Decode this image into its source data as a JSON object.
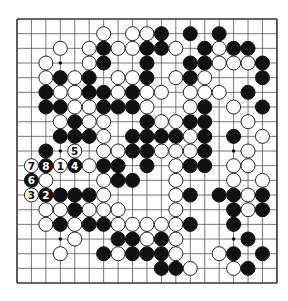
{
  "board": {
    "size": 19,
    "origin_x": 17,
    "origin_y": 19,
    "step_x": 14.44,
    "step_y": 14.67,
    "line_color": "#555555",
    "border_color": "#333333",
    "black_color": "#111111",
    "white_fill": "#ffffff",
    "white_stroke": "#222222",
    "hoshi": [
      [
        3,
        3
      ],
      [
        3,
        9
      ],
      [
        3,
        15
      ],
      [
        9,
        3
      ],
      [
        9,
        9
      ],
      [
        9,
        15
      ],
      [
        15,
        3
      ],
      [
        15,
        9
      ],
      [
        15,
        15
      ]
    ],
    "rows": [
      "...................",
      "......W.WWB.B.B....",
      "...W.WBWWBBW.BWBB..",
      "..W..WB..B..BBWWWB.",
      "..WBWB.WWB.WBW...B.",
      "..BWWBBWBWW.WWW.B..",
      "..BBWWBBBW..WB.W.B.",
      "...WBWW..BWWBB..W..",
      "...BBBW.BBBBWB.B.W.",
      "..B.W.WWBBWWWB..W..",
      ".WBWBWBB.B.WBB.WW..",
      ".BW...WBB..W...W.W.",
      ".WBBBBW....WB.BBWB.",
      "..WWBWWW...W...BWB.",
      "..WBWBBWWWWWB..B...",
      "....W..BBWBW....B..",
      "...W..BWBBBW..WB.B.",
      "..........BBW..WB..",
      "..................."
    ],
    "labels": [
      {
        "row": 10,
        "col": 3,
        "text": "1",
        "color": "W"
      },
      {
        "row": 12,
        "col": 2,
        "text": "2",
        "color": "B"
      },
      {
        "row": 12,
        "col": 1,
        "text": "3",
        "color": "W"
      },
      {
        "row": 10,
        "col": 4,
        "text": "4",
        "color": "B"
      },
      {
        "row": 9,
        "col": 4,
        "text": "5",
        "color": "W"
      },
      {
        "row": 11,
        "col": 1,
        "text": "6",
        "color": "B"
      },
      {
        "row": 10,
        "col": 1,
        "text": "7",
        "color": "W"
      },
      {
        "row": 10,
        "col": 2,
        "text": "8",
        "color": "B"
      }
    ]
  }
}
